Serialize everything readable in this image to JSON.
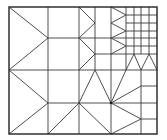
{
  "diagram": {
    "title": "",
    "type": "adaptive-triangular-mesh",
    "colors": {
      "line": "#3a3a3a",
      "border": "#222222",
      "background": "#ffffff"
    },
    "border": {
      "x": 9,
      "y": 7,
      "w": 148,
      "h": 127
    },
    "nodes": [
      [
        111,
        103
      ]
    ],
    "segments": [
      [
        48,
        7,
        48,
        134
      ],
      [
        79,
        7,
        79,
        134
      ],
      [
        111,
        7,
        111,
        134
      ],
      [
        95,
        7,
        95,
        70
      ],
      [
        126,
        7,
        126,
        70
      ],
      [
        134,
        7,
        134,
        54
      ],
      [
        141,
        7,
        141,
        54
      ],
      [
        149,
        7,
        149,
        54
      ],
      [
        141,
        70,
        141,
        134
      ],
      [
        9,
        70,
        157,
        70
      ],
      [
        48,
        38,
        126,
        38
      ],
      [
        48,
        103,
        157,
        103
      ],
      [
        126,
        15,
        157,
        15
      ],
      [
        126,
        23,
        157,
        23
      ],
      [
        126,
        31,
        157,
        31
      ],
      [
        126,
        38,
        157,
        38
      ],
      [
        126,
        46,
        157,
        46
      ],
      [
        95,
        54,
        157,
        54
      ],
      [
        141,
        86,
        157,
        86
      ],
      [
        141,
        119,
        157,
        119
      ],
      [
        9,
        7,
        48,
        38
      ],
      [
        9,
        70,
        48,
        38
      ],
      [
        79,
        7,
        95,
        23
      ],
      [
        79,
        38,
        95,
        23
      ],
      [
        79,
        38,
        95,
        54
      ],
      [
        79,
        70,
        95,
        54
      ],
      [
        111,
        7,
        126,
        15
      ],
      [
        111,
        23,
        126,
        15
      ],
      [
        111,
        23,
        126,
        31
      ],
      [
        111,
        38,
        126,
        31
      ],
      [
        111,
        38,
        126,
        46
      ],
      [
        111,
        54,
        126,
        46
      ],
      [
        126,
        70,
        134,
        54
      ],
      [
        134,
        54,
        141,
        70
      ],
      [
        141,
        70,
        149,
        54
      ],
      [
        149,
        54,
        157,
        70
      ],
      [
        9,
        70,
        48,
        103
      ],
      [
        9,
        134,
        48,
        103
      ],
      [
        48,
        134,
        79,
        103
      ],
      [
        79,
        103,
        95,
        70
      ],
      [
        95,
        70,
        111,
        103
      ],
      [
        111,
        103,
        126,
        70
      ],
      [
        111,
        103,
        141,
        86
      ],
      [
        111,
        103,
        141,
        119
      ],
      [
        111,
        134,
        141,
        119
      ],
      [
        79,
        103,
        111,
        134
      ]
    ]
  }
}
